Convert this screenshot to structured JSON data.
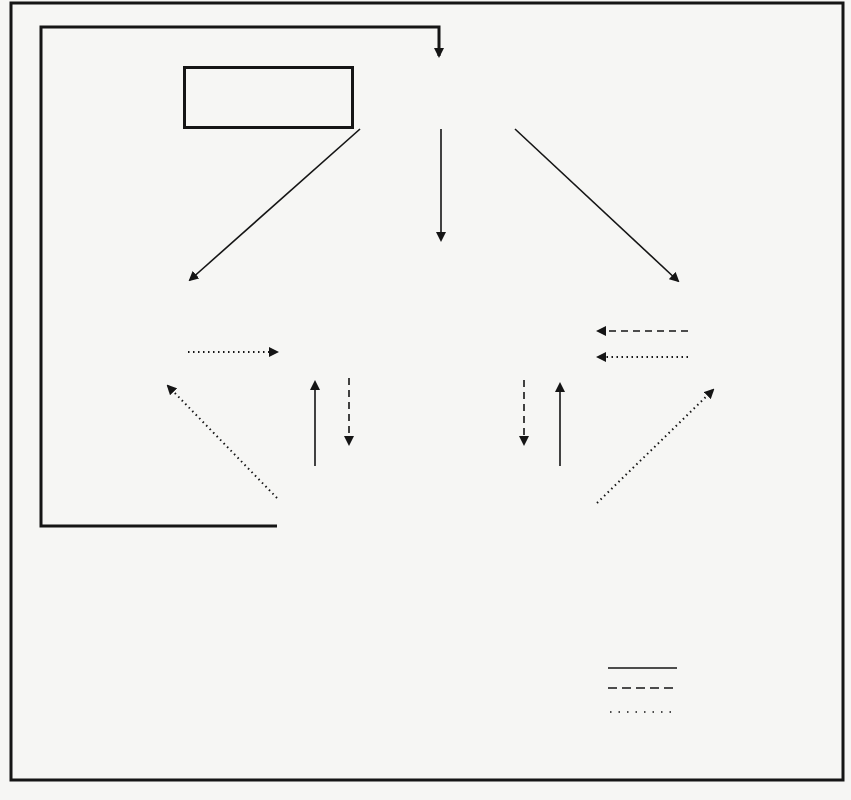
{
  "diagram": {
    "type": "flow",
    "nodes": {
      "funding": {
        "title": "Funding Agencies*",
        "subtitle": "\"Third Parties\""
      },
      "planning": {
        "title": "Planning"
      },
      "providers": {
        "title": "Providers",
        "left": "Professionals",
        "right": "Institutions"
      },
      "university": {
        "title": "University",
        "line1": "Manpower",
        "line2": "Knowledge"
      },
      "population": {
        "title": "Defined Population",
        "left": "Enrolled",
        "right": "Enumerated"
      }
    },
    "edge_labels": {
      "fees": "\"Fees\"",
      "services": "Services",
      "data_left": "Data",
      "data_right": "Data"
    },
    "edges": [
      {
        "from": "population",
        "to": "funding",
        "kind": "money"
      },
      {
        "from": "funding",
        "to": "planning",
        "kind": "money"
      },
      {
        "from": "funding",
        "to": "providers",
        "kind": "money"
      },
      {
        "from": "funding",
        "to": "university",
        "kind": "money"
      },
      {
        "from": "population",
        "to": "providers",
        "kind": "money",
        "label": "\"Fees\""
      },
      {
        "from": "providers",
        "to": "population",
        "kind": "services",
        "label": "Services"
      },
      {
        "from": "university",
        "to": "providers",
        "kind": "services"
      },
      {
        "from": "university",
        "to": "providers",
        "kind": "information"
      },
      {
        "from": "planning",
        "to": "providers",
        "kind": "information"
      },
      {
        "from": "population",
        "to": "planning",
        "kind": "information",
        "label": "Data"
      },
      {
        "from": "population",
        "to": "university",
        "kind": "information",
        "label": "Data"
      }
    ]
  },
  "legend": {
    "title": "Code",
    "items": [
      {
        "style": "solid",
        "label": "Money"
      },
      {
        "style": "dashed",
        "label": "Services"
      },
      {
        "style": "dotted",
        "label": "Information",
        "label2": "and Data"
      }
    ]
  },
  "footnotes": {
    "left": "*Operating Funds",
    "right": "*Capital Funds"
  }
}
